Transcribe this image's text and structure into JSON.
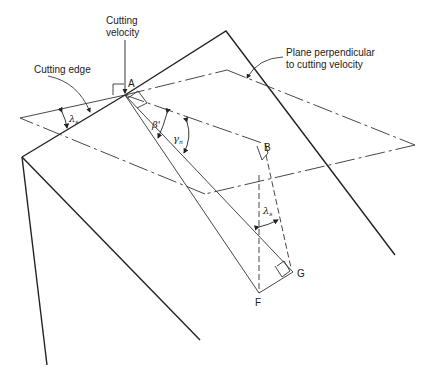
{
  "diagram": {
    "labels": {
      "cutting_velocity_line1": "Cutting",
      "cutting_velocity_line2": "velocity",
      "cutting_edge": "Cutting edge",
      "plane_line1": "Plane perpendicular",
      "plane_line2": "to cutting velocity"
    },
    "points": {
      "A": "A",
      "B": "B",
      "F": "F",
      "G": "G"
    },
    "angles": {
      "lambda_s_left": "λ",
      "lambda_s_left_sub": "s",
      "lambda_s_right": "λ",
      "lambda_s_right_sub": "s",
      "beta_prime": "β'",
      "gamma_n": "γ",
      "gamma_n_sub": "n"
    },
    "colors": {
      "line": "#222222",
      "background": "#ffffff"
    }
  }
}
